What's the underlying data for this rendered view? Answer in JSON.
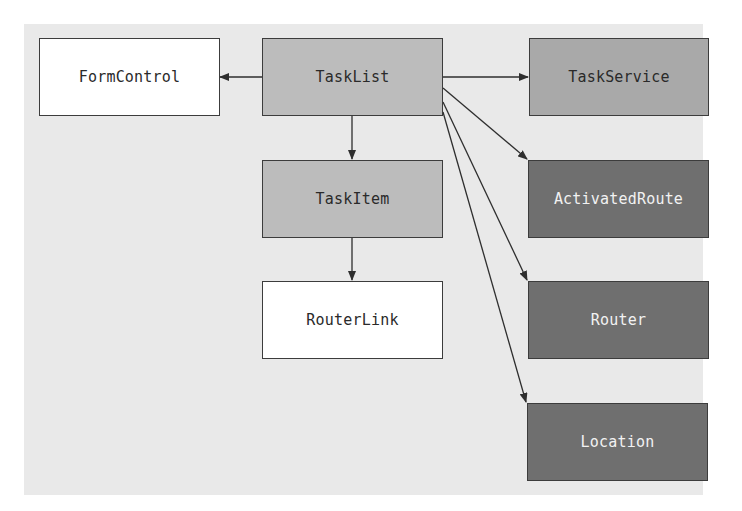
{
  "diagram": {
    "colors": {
      "background_panel": "#e9e9e9",
      "white_box": "#ffffff",
      "light_box": "#bcbcbc",
      "medium_box": "#a9a9a9",
      "dark_box": "#6f6f6f",
      "dark_text": "#2a2a2a",
      "light_text": "#f2f2f2",
      "line": "#2e2e2e"
    },
    "nodes": [
      {
        "id": "FormControl",
        "label": "FormControl"
      },
      {
        "id": "TaskList",
        "label": "TaskList"
      },
      {
        "id": "TaskService",
        "label": "TaskService"
      },
      {
        "id": "TaskItem",
        "label": "TaskItem"
      },
      {
        "id": "ActivatedRoute",
        "label": "ActivatedRoute"
      },
      {
        "id": "RouterLink",
        "label": "RouterLink"
      },
      {
        "id": "Router",
        "label": "Router"
      },
      {
        "id": "Location",
        "label": "Location"
      }
    ],
    "edges": [
      {
        "from": "TaskList",
        "to": "FormControl"
      },
      {
        "from": "TaskList",
        "to": "TaskService"
      },
      {
        "from": "TaskList",
        "to": "TaskItem"
      },
      {
        "from": "TaskList",
        "to": "ActivatedRoute"
      },
      {
        "from": "TaskList",
        "to": "Router"
      },
      {
        "from": "TaskList",
        "to": "Location"
      },
      {
        "from": "TaskItem",
        "to": "RouterLink"
      }
    ]
  }
}
